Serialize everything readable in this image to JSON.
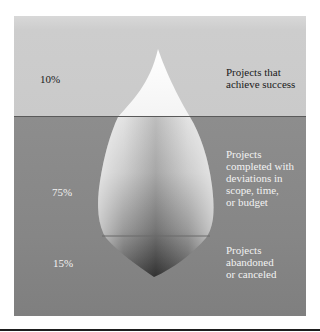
{
  "diagram": {
    "type": "iceberg",
    "colors": {
      "above_water": "#cacaca",
      "below_water": "#878787",
      "waterline": "#5a5a5a",
      "iceberg_top": "#ffffff",
      "iceberg_bottom": "#3a3a3a"
    },
    "layers": [
      {
        "percent": "10%",
        "label": "Projects that\nachieve success"
      },
      {
        "percent": "75%",
        "label": "Projects\ncompleted with\ndeviations in\nscope, time,\nor budget"
      },
      {
        "percent": "15%",
        "label": "Projects\nabandoned\nor canceled"
      }
    ]
  }
}
